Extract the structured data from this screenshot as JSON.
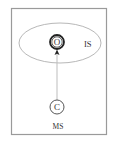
{
  "diagram": {
    "frame": {
      "stroke": "#9a9a9a"
    },
    "region": {
      "label": "IS",
      "stroke": "#b8b8b8"
    },
    "nodes": [
      {
        "id": "O",
        "label": "O",
        "style": "double-ring"
      },
      {
        "id": "C",
        "label": "C",
        "style": "single-ring"
      }
    ],
    "edges": [
      {
        "from": "C",
        "to": "O",
        "arrow": "filled"
      }
    ],
    "bottom_label": "MS",
    "colors": {
      "edge": "#bdbdbd",
      "node_stroke": "#222222",
      "text": "#333333"
    }
  }
}
